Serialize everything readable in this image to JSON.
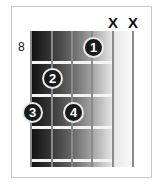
{
  "chord_diagram": {
    "start_fret": "8",
    "muted": [
      {
        "string": 5,
        "symbol": "X"
      },
      {
        "string": 6,
        "symbol": "X"
      }
    ],
    "fingers": [
      {
        "finger": "1",
        "string": 4,
        "fret_row": 1
      },
      {
        "finger": "2",
        "string": 2,
        "fret_row": 2
      },
      {
        "finger": "3",
        "string": 1,
        "fret_row": 3
      },
      {
        "finger": "4",
        "string": 3,
        "fret_row": 3
      }
    ],
    "colors": {
      "fingerboard_dark": "#111111",
      "fingerboard_light": "#fbfbfb",
      "dot": "#1a1a1a",
      "string": "#8a8a8a"
    }
  }
}
